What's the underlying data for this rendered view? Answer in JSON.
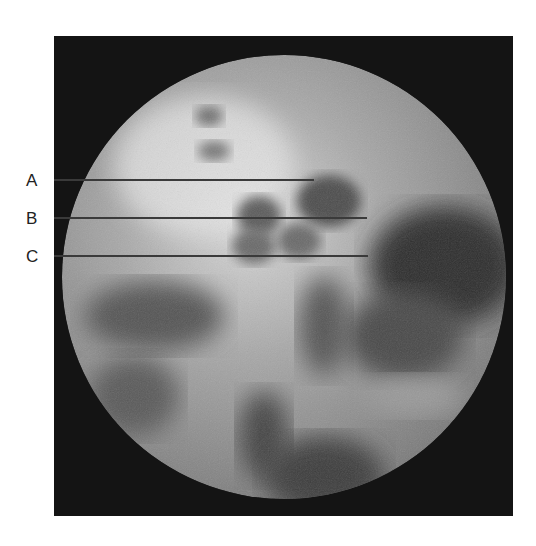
{
  "figure": {
    "background_color": "#ffffff",
    "frame_color": "#131313",
    "labels": [
      {
        "text": "A",
        "y": 180,
        "line_end_x": 314
      },
      {
        "text": "B",
        "y": 218,
        "line_end_x": 367
      },
      {
        "text": "C",
        "y": 256,
        "line_end_x": 368
      }
    ],
    "line_color": "#3a3a3a"
  }
}
